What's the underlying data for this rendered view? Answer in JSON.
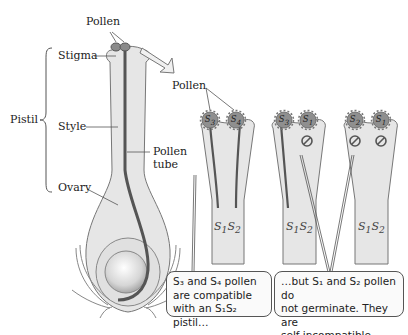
{
  "diagram": {
    "type": "biology-illustration",
    "topic": "Gametophytic self-incompatibility in a pistil"
  },
  "left_figure": {
    "labels": {
      "pollen": "Pollen",
      "stigma": "Stigma",
      "style": "Style",
      "pistil": "Pistil",
      "pollen_tube_line1": "Pollen",
      "pollen_tube_line2": "tube",
      "ovary": "Ovary"
    }
  },
  "right_figure": {
    "pollen_label": "Pollen",
    "pistils": [
      {
        "genotype_display": "S1S2",
        "pollen": [
          {
            "allele": "S3",
            "germinates": true
          },
          {
            "allele": "S4",
            "germinates": true
          }
        ]
      },
      {
        "genotype_display": "S1S2",
        "pollen": [
          {
            "allele": "S3",
            "germinates": true
          },
          {
            "allele": "S1",
            "germinates": false
          }
        ]
      },
      {
        "genotype_display": "S1S2",
        "pollen": [
          {
            "allele": "S2",
            "germinates": false
          },
          {
            "allele": "S1",
            "germinates": false
          }
        ]
      }
    ],
    "callouts": {
      "compatible": {
        "line1": "S₃ and S₄ pollen",
        "line2": "are compatible",
        "line3": "with an S₁S₂ pistil…"
      },
      "incompatible": {
        "line1": "…but S₁ and S₂ pollen do",
        "line2": "not germinate. They are",
        "line3": "self-incompatible."
      }
    }
  },
  "colors": {
    "tissue_fill": "#e6e6e6",
    "outline": "#777777",
    "pollen_tube": "#555555",
    "pollen_grain": "#8a8a8a",
    "text": "#222222"
  }
}
